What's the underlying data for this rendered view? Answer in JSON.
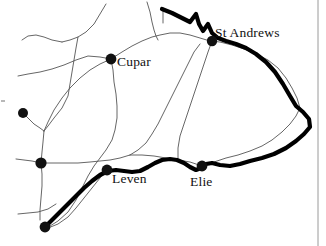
{
  "map": {
    "title": "Sketch map of east Fife",
    "region": "Fife",
    "background_color": "#ffffff",
    "ink_color": "#111111",
    "road_color": "#555555",
    "coast_color": "#000000",
    "width": 326,
    "height": 246,
    "labels": [
      {
        "id": "st-andrews",
        "text": "St Andrews",
        "x": 215,
        "y": 26
      },
      {
        "id": "cupar",
        "text": "Cupar",
        "x": 117,
        "y": 55
      },
      {
        "id": "leven",
        "text": "Leven",
        "x": 112,
        "y": 172
      },
      {
        "id": "elie",
        "text": "Elie",
        "x": 190,
        "y": 175
      }
    ],
    "settlements": [
      {
        "id": "st-andrews",
        "label": "St Andrews",
        "cx": 212,
        "cy": 41,
        "r": 5.2,
        "labelled": true
      },
      {
        "id": "cupar",
        "label": "Cupar",
        "cx": 111,
        "cy": 59,
        "r": 5.4,
        "labelled": true
      },
      {
        "id": "leven",
        "label": "Leven",
        "cx": 107,
        "cy": 170,
        "r": 5.4,
        "labelled": true
      },
      {
        "id": "elie",
        "label": "Elie",
        "cx": 202,
        "cy": 166,
        "r": 5.4,
        "labelled": true
      },
      {
        "id": "node-west-upper",
        "label": "",
        "cx": 23,
        "cy": 113,
        "r": 5.0,
        "labelled": false
      },
      {
        "id": "node-west-lower",
        "label": "",
        "cx": 41,
        "cy": 163,
        "r": 5.6,
        "labelled": false
      },
      {
        "id": "node-south-west",
        "label": "",
        "cx": 45,
        "cy": 227,
        "r": 5.4,
        "labelled": false
      }
    ],
    "coastline": {
      "id": "coastline",
      "stroke_width": 4.2,
      "path": "M 162 9 L 172 13 L 182 18 L 190 22 L 196 14 L 199 24 L 203 31 L 208 24 L 212 33 L 218 38 L 226 41 L 236 44 L 246 48 L 256 54 L 266 62 L 275 72 L 283 84 L 290 96 L 296 106 L 303 112 L 309 119 L 310 127 L 304 134 L 296 141 L 286 148 L 274 154 L 262 158 L 250 161 L 240 164 L 230 166 L 220 165 L 212 163 L 206 164 L 201 168 L 196 170 L 190 167 L 184 163 L 177 160 L 170 159 L 162 160 L 155 163 L 148 167 L 140 171 L 132 172 L 124 171 L 116 170 L 108 171 L 100 175 L 92 181 L 84 188 L 76 196 L 68 204 L 60 212 L 52 220 L 46 226"
    },
    "roads": [
      {
        "id": "road-north-spur",
        "path": "M 147 2 L 150 12 L 152 22 L 154 30 L 156 36 L 158 40"
      },
      {
        "id": "road-tick-eden",
        "path": "M 163 8 L 163 23"
      },
      {
        "id": "road-cupar-ne",
        "path": "M 111 59 L 122 52 L 132 46 L 142 41 L 152 37 L 160 35 L 170 33 L 180 33 L 190 35 L 200 38 L 210 41"
      },
      {
        "id": "road-upper-left-branch",
        "path": "M 106 4 L 100 14 L 94 24 L 86 32 L 78 37 L 70 40 L 62 42"
      },
      {
        "id": "road-upper-left-west",
        "path": "M 62 42 L 52 40 L 44 37 L 36 35 L 28 36 L 22 40"
      },
      {
        "id": "road-mid-west",
        "path": "M 18 76 L 28 74 L 40 72 L 52 69 L 64 65 L 76 60 L 88 56 L 100 57 L 111 59"
      },
      {
        "id": "road-cupar-west-diag",
        "path": "M 111 59 L 100 64 L 90 70 L 80 78 L 70 88 L 62 98 L 54 110 L 48 122 L 44 131"
      },
      {
        "id": "road-north-mid-down",
        "path": "M 78 37 L 76 48 L 74 60 L 72 72 L 70 84 L 68 96 L 62 108 L 54 118 L 48 126 L 44 131"
      },
      {
        "id": "road-west-dot-link",
        "path": "M 23 113 L 28 118 L 34 124 L 40 128 L 44 131"
      },
      {
        "id": "road-junction-down",
        "path": "M 44 131 L 43 142 L 42 152 L 41 163"
      },
      {
        "id": "road-junction-west",
        "path": "M 41 163 L 32 161 L 24 160 L 16 159"
      },
      {
        "id": "road-junction-east",
        "path": "M 41 163 L 54 163 L 66 163 L 78 163 L 90 162 L 100 161 L 110 160 L 120 158 L 130 155"
      },
      {
        "id": "road-junction-southdown",
        "path": "M 41 163 L 42 174 L 42 186 L 41 198 L 40 210 L 40 220"
      },
      {
        "id": "road-far-west-low",
        "path": "M 18 214 L 28 213 L 38 212 L 48 209 L 56 204"
      },
      {
        "id": "road-cupar-south",
        "path": "M 111 59 L 113 70 L 114 82 L 116 94 L 117 106 L 117 118 L 115 130 L 112 140 L 106 150 L 100 158 L 94 166 L 88 176 L 82 188 L 76 200 L 68 212 L 58 221 L 50 226"
      },
      {
        "id": "road-leven-inland",
        "path": "M 107 170 L 100 178 L 92 188 L 84 198 L 76 208 L 68 217 L 58 224 L 48 228"
      },
      {
        "id": "road-mid-valley",
        "path": "M 130 155 L 138 150 L 146 143 L 152 134 L 158 124 L 164 112 L 170 100 L 176 88 L 182 76 L 188 64 L 194 52 L 200 44"
      },
      {
        "id": "road-mid-valley-lower",
        "path": "M 130 155 L 142 155 L 154 156 L 166 158 L 178 160 L 190 162 L 202 166"
      },
      {
        "id": "road-elie-east",
        "path": "M 202 166 L 214 162 L 226 158 L 238 155 L 250 151 L 262 146 L 272 140 L 282 132 L 290 124 L 296 116 L 300 108"
      },
      {
        "id": "road-east-inland",
        "path": "M 300 108 L 297 98 L 292 88 L 286 78 L 278 68 L 268 60 L 256 54 L 244 49 L 232 45 L 220 42 L 210 41"
      },
      {
        "id": "road-standrews-south",
        "path": "M 212 41 L 208 52 L 204 64 L 200 76 L 196 88 L 192 100 L 188 112 L 184 124 L 180 136 L 178 148 L 178 158"
      }
    ],
    "edge_marks": [
      {
        "id": "left-edge-tick",
        "x1": 1,
        "y1": 101,
        "x2": 5,
        "y2": 101
      },
      {
        "id": "page-border-right",
        "x1": 318,
        "y1": 0,
        "x2": 318,
        "y2": 246
      }
    ]
  }
}
